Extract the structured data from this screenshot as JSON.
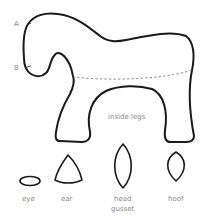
{
  "diagram": {
    "points": [
      {
        "id": "A",
        "label": "A"
      },
      {
        "id": "B",
        "label": "B"
      }
    ],
    "main_piece": {
      "name": "body",
      "fold_line": "dashed",
      "inner_label": "inside legs"
    },
    "small_pieces": [
      {
        "name": "eye",
        "label": "eye"
      },
      {
        "name": "ear",
        "label": "ear"
      },
      {
        "name": "head-gusset",
        "label_line1": "head",
        "label_line2": "gusset"
      },
      {
        "name": "hoof",
        "label": "hoof"
      }
    ],
    "colors": {
      "outline": "#1a1a1a",
      "label": "#8a8a8a",
      "dashed": "#777777"
    }
  }
}
